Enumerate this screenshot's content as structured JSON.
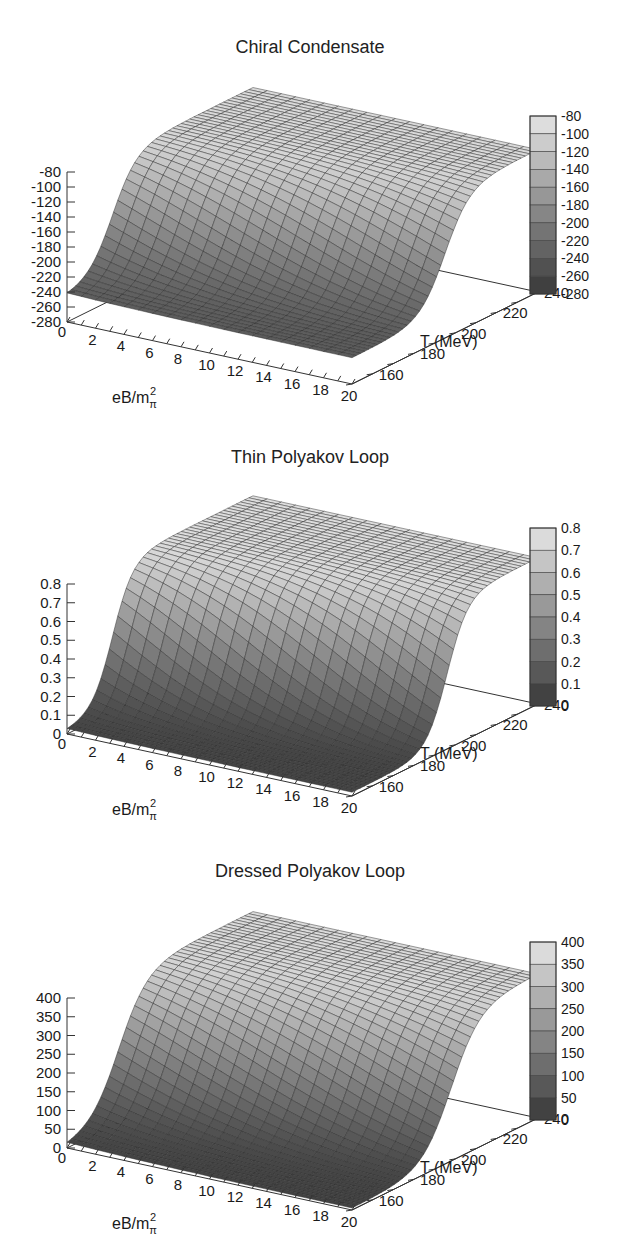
{
  "chart_data": [
    {
      "type": "surface3d",
      "title": "Chiral Condensate",
      "xlabel": "eB/m_π²",
      "ylabel": "T (MeV)",
      "zlabel": "",
      "x_ticks": [
        0,
        2,
        4,
        6,
        8,
        10,
        12,
        14,
        16,
        18,
        20
      ],
      "y_ticks": [
        160,
        180,
        200,
        220,
        240
      ],
      "z_ticks": [
        -80,
        -100,
        -120,
        -140,
        -160,
        -180,
        -200,
        -220,
        -240,
        -260,
        -280
      ],
      "xlim": [
        0,
        20
      ],
      "ylim": [
        150,
        240
      ],
      "zlim": [
        -280,
        -80
      ],
      "colorbar_ticks": [
        -80,
        -100,
        -120,
        -140,
        -160,
        -180,
        -200,
        -220,
        -240,
        -260,
        -280
      ],
      "colormap": "grayscale (dark = low, light = high)",
      "description": "Sigmoid rise in T: ~-245 at low T across eB, rising steeply near T≈170-195 MeV to ~-90 at high T; transition shifts to higher T with increasing eB",
      "surface": {
        "low_value": -245,
        "high_value": -90,
        "transition_T_at_eB0": 172,
        "transition_T_at_eB20": 195,
        "width": 6
      }
    },
    {
      "type": "surface3d",
      "title": "Thin Polyakov Loop",
      "xlabel": "eB/m_π²",
      "ylabel": "T (MeV)",
      "zlabel": "",
      "x_ticks": [
        0,
        2,
        4,
        6,
        8,
        10,
        12,
        14,
        16,
        18,
        20
      ],
      "y_ticks": [
        160,
        180,
        200,
        220,
        240
      ],
      "z_ticks": [
        0,
        0.1,
        0.2,
        0.3,
        0.4,
        0.5,
        0.6,
        0.7,
        0.8
      ],
      "xlim": [
        0,
        20
      ],
      "ylim": [
        150,
        240
      ],
      "zlim": [
        0,
        0.8
      ],
      "colorbar_ticks": [
        0.8,
        0.7,
        0.6,
        0.5,
        0.4,
        0.3,
        0.2,
        0.1,
        0
      ],
      "colormap": "grayscale (dark = low, light = high)",
      "description": "Near 0 at low T, steep rise near T≈170-195 MeV to ~0.75 at high T; transition shifts to higher T with increasing eB",
      "surface": {
        "low_value": 0.02,
        "high_value": 0.78,
        "transition_T_at_eB0": 172,
        "transition_T_at_eB20": 196,
        "width": 5
      }
    },
    {
      "type": "surface3d",
      "title": "Dressed Polyakov Loop",
      "xlabel": "eB/m_π²",
      "ylabel": "T (MeV)",
      "zlabel": "",
      "x_ticks": [
        0,
        2,
        4,
        6,
        8,
        10,
        12,
        14,
        16,
        18,
        20
      ],
      "y_ticks": [
        160,
        180,
        200,
        220,
        240
      ],
      "z_ticks": [
        0,
        50,
        100,
        150,
        200,
        250,
        300,
        350,
        400
      ],
      "xlim": [
        0,
        20
      ],
      "ylim": [
        150,
        240
      ],
      "zlim": [
        0,
        400
      ],
      "colorbar_ticks": [
        400,
        350,
        300,
        250,
        200,
        150,
        100,
        50,
        0
      ],
      "colormap": "grayscale (dark = low, light = high)",
      "description": "Near 0 at low T, steep rise near T≈170-200 MeV to ~390 at high T; transition shifts to higher T with increasing eB",
      "surface": {
        "low_value": 5,
        "high_value": 385,
        "transition_T_at_eB0": 175,
        "transition_T_at_eB20": 198,
        "width": 7
      }
    }
  ]
}
